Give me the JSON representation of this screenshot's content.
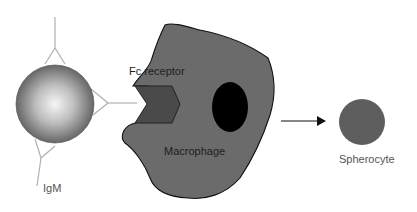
{
  "figure": {
    "labels": {
      "fc_receptor": "Fc receptor",
      "macrophage": "Macrophage",
      "spherocyte": "Spherocyte",
      "igm": "IgM"
    },
    "colors": {
      "antibody_lines": "#b0b0b0",
      "red_cell_highlight": "#f4f4f4",
      "red_cell_shadow": "#555555",
      "macrophage_fill": "#6b6b6b",
      "macrophage_outline": "#111111",
      "receptor_fill": "#4a4a4a",
      "nucleus_fill": "#000000",
      "spherocyte_fill": "#5e5e5e",
      "arrow": "#111111"
    }
  }
}
